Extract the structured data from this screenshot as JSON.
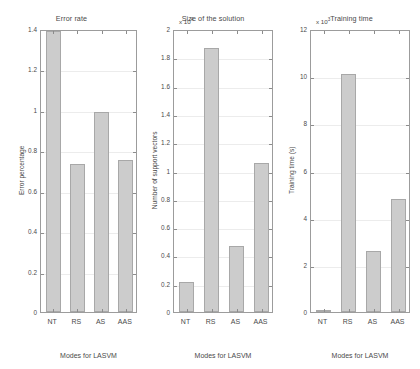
{
  "figure": {
    "background": "#ffffff",
    "bar_fill": "#cccccc",
    "bar_edge": "#a8a8a8",
    "axis_color": "#9c9c9c",
    "grid_color": "#ececec"
  },
  "chart_data": [
    {
      "type": "bar",
      "title": "Error rate",
      "xlabel": "Modes for LASVM",
      "ylabel": "Error percentage",
      "categories": [
        "NT",
        "RS",
        "AS",
        "AAS"
      ],
      "values": [
        1.39,
        0.73,
        0.99,
        0.75
      ],
      "ylim": [
        0,
        1.4
      ],
      "yticks": [
        0,
        0.2,
        0.4,
        0.6,
        0.8,
        1,
        1.2,
        1.4
      ],
      "ytick_labels": [
        "0",
        "0.2",
        "0.4",
        "0.6",
        "0.8",
        "1",
        "1.2",
        "1.4"
      ],
      "exponent_label": "",
      "grid": true,
      "legend": "none"
    },
    {
      "type": "bar",
      "title": "Size of the solution",
      "xlabel": "Modes for LASVM",
      "ylabel": "Number of support vectors",
      "categories": [
        "NT",
        "RS",
        "AS",
        "AAS"
      ],
      "values": [
        0.215,
        1.865,
        0.465,
        1.055
      ],
      "ylim": [
        0,
        2
      ],
      "yticks": [
        0,
        0.2,
        0.4,
        0.6,
        0.8,
        1,
        1.2,
        1.4,
        1.6,
        1.8,
        2
      ],
      "ytick_labels": [
        "0",
        "0.2",
        "0.4",
        "0.6",
        "0.8",
        "1",
        "1.2",
        "1.4",
        "1.6",
        "1.8",
        "2"
      ],
      "exponent_label": "x 10",
      "exponent_power": "4",
      "grid": true,
      "legend": "none"
    },
    {
      "type": "bar",
      "title": "Training time",
      "xlabel": "Modes for LASVM",
      "ylabel": "Training time (s)",
      "categories": [
        "NT",
        "RS",
        "AS",
        "AAS"
      ],
      "values": [
        0.05,
        10.1,
        2.6,
        4.8
      ],
      "ylim": [
        0,
        12
      ],
      "yticks": [
        0,
        2,
        4,
        6,
        8,
        10,
        12
      ],
      "ytick_labels": [
        "0",
        "2",
        "4",
        "6",
        "8",
        "10",
        "12"
      ],
      "exponent_label": "x 10",
      "exponent_power": "3",
      "grid": true,
      "legend": "none"
    }
  ]
}
